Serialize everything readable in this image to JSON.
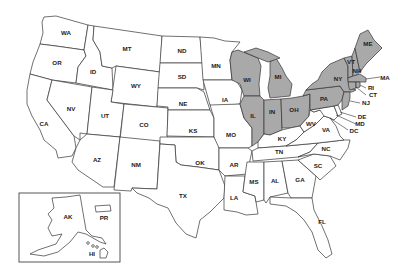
{
  "map": {
    "title": "",
    "colors": {
      "highlighted": "#a9a9a9",
      "default": "#ffffff",
      "border": "#333333"
    },
    "highlighted_states": [
      "WI",
      "MI",
      "IL",
      "IN",
      "OH",
      "PA",
      "NY",
      "VT",
      "NH",
      "ME",
      "MA",
      "RI",
      "CT",
      "NJ"
    ],
    "states": [
      {
        "code": "WA",
        "label": "WA",
        "highlighted": false
      },
      {
        "code": "OR",
        "label": "OR",
        "highlighted": false
      },
      {
        "code": "CA",
        "label": "CA",
        "highlighted": false
      },
      {
        "code": "ID",
        "label": "ID",
        "highlighted": false
      },
      {
        "code": "NV",
        "label": "NV",
        "highlighted": false
      },
      {
        "code": "MT",
        "label": "MT",
        "highlighted": false
      },
      {
        "code": "WY",
        "label": "WY",
        "highlighted": false
      },
      {
        "code": "UT",
        "label": "UT",
        "highlighted": false
      },
      {
        "code": "AZ",
        "label": "AZ",
        "highlighted": false
      },
      {
        "code": "CO",
        "label": "CO",
        "highlighted": false
      },
      {
        "code": "NM",
        "label": "NM",
        "highlighted": false
      },
      {
        "code": "ND",
        "label": "ND",
        "highlighted": false
      },
      {
        "code": "SD",
        "label": "SD",
        "highlighted": false
      },
      {
        "code": "NE",
        "label": "NE",
        "highlighted": false
      },
      {
        "code": "KS",
        "label": "KS",
        "highlighted": false
      },
      {
        "code": "OK",
        "label": "OK",
        "highlighted": false
      },
      {
        "code": "TX",
        "label": "TX",
        "highlighted": false
      },
      {
        "code": "MN",
        "label": "MN",
        "highlighted": false
      },
      {
        "code": "IA",
        "label": "IA",
        "highlighted": false
      },
      {
        "code": "MO",
        "label": "MO",
        "highlighted": false
      },
      {
        "code": "AR",
        "label": "AR",
        "highlighted": false
      },
      {
        "code": "LA",
        "label": "LA",
        "highlighted": false
      },
      {
        "code": "WI",
        "label": "WI",
        "highlighted": true
      },
      {
        "code": "IL",
        "label": "IL",
        "highlighted": true
      },
      {
        "code": "MI",
        "label": "MI",
        "highlighted": true
      },
      {
        "code": "IN",
        "label": "IN",
        "highlighted": true
      },
      {
        "code": "OH",
        "label": "OH",
        "highlighted": true
      },
      {
        "code": "KY",
        "label": "KY",
        "highlighted": false
      },
      {
        "code": "TN",
        "label": "TN",
        "highlighted": false
      },
      {
        "code": "MS",
        "label": "MS",
        "highlighted": false
      },
      {
        "code": "AL",
        "label": "AL",
        "highlighted": false
      },
      {
        "code": "GA",
        "label": "GA",
        "highlighted": false
      },
      {
        "code": "FL",
        "label": "FL",
        "highlighted": false
      },
      {
        "code": "SC",
        "label": "SC",
        "highlighted": false
      },
      {
        "code": "NC",
        "label": "NC",
        "highlighted": false
      },
      {
        "code": "VA",
        "label": "VA",
        "highlighted": false
      },
      {
        "code": "WV",
        "label": "WV",
        "highlighted": false
      },
      {
        "code": "PA",
        "label": "PA",
        "highlighted": true
      },
      {
        "code": "NY",
        "label": "NY",
        "highlighted": true
      },
      {
        "code": "VT",
        "label": "VT",
        "highlighted": true
      },
      {
        "code": "NH",
        "label": "NH",
        "highlighted": true
      },
      {
        "code": "ME",
        "label": "ME",
        "highlighted": true
      },
      {
        "code": "MA",
        "label": "MA",
        "highlighted": true
      },
      {
        "code": "RI",
        "label": "RI",
        "highlighted": true
      },
      {
        "code": "CT",
        "label": "CT",
        "highlighted": true
      },
      {
        "code": "NJ",
        "label": "NJ",
        "highlighted": true
      },
      {
        "code": "DE",
        "label": "DE",
        "highlighted": false
      },
      {
        "code": "MD",
        "label": "MD",
        "highlighted": false
      },
      {
        "code": "DC",
        "label": "DC",
        "highlighted": false
      },
      {
        "code": "AK",
        "label": "AK",
        "highlighted": false
      },
      {
        "code": "HI",
        "label": "HI",
        "highlighted": false
      },
      {
        "code": "PR",
        "label": "PR",
        "highlighted": false
      }
    ],
    "labels": {
      "WA": "WA",
      "OR": "OR",
      "CA": "CA",
      "ID": "ID",
      "NV": "NV",
      "MT": "MT",
      "WY": "WY",
      "UT": "UT",
      "AZ": "AZ",
      "CO": "CO",
      "NM": "NM",
      "ND": "ND",
      "SD": "SD",
      "NE": "NE",
      "KS": "KS",
      "OK": "OK",
      "TX": "TX",
      "MN": "MN",
      "IA": "IA",
      "MO": "MO",
      "AR": "AR",
      "LA": "LA",
      "WI": "WI",
      "IL": "IL",
      "MI": "MI",
      "IN": "IN",
      "OH": "OH",
      "KY": "KY",
      "TN": "TN",
      "MS": "MS",
      "AL": "AL",
      "GA": "GA",
      "FL": "FL",
      "SC": "SC",
      "NC": "NC",
      "VA": "VA",
      "WV": "WV",
      "PA": "PA",
      "NY": "NY",
      "VT": "VT",
      "NH": "NH",
      "ME": "ME",
      "MA": "MA",
      "RI": "RI",
      "CT": "CT",
      "NJ": "NJ",
      "DE": "DE",
      "MD": "MD",
      "DC": "DC",
      "AK": "AK",
      "HI": "HI",
      "PR": "PR"
    },
    "inset": {
      "contains": [
        "AK",
        "PR",
        "HI"
      ]
    }
  }
}
